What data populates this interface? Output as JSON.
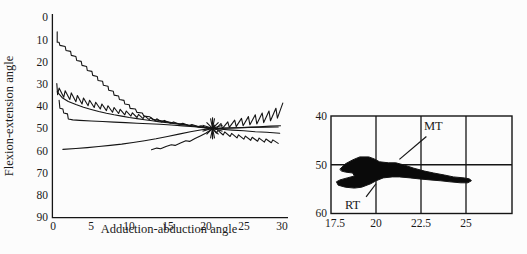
{
  "chart_data": [
    {
      "id": "flexion-vs-adduction",
      "type": "line",
      "xlabel": "Adduction-abduction angle",
      "ylabel": "Flexion-extension angle",
      "xlim": [
        0,
        30
      ],
      "ylim": [
        0,
        90
      ],
      "y_axis_inverted": true,
      "grid": false,
      "x_tick_labels": [
        "0",
        "5",
        "10",
        "15",
        "20",
        "25",
        "30"
      ],
      "x_tick_values": [
        0,
        5,
        10,
        15,
        20,
        25,
        30
      ],
      "y_tick_labels": [
        "0",
        "10",
        "20",
        "30",
        "40",
        "50",
        "60",
        "70",
        "80",
        "90"
      ],
      "y_tick_values": [
        0,
        10,
        20,
        30,
        40,
        50,
        60,
        70,
        80,
        90
      ],
      "line_color": "#151515",
      "convergence_marker": {
        "x": 20.9,
        "y": 50,
        "style": "asterisk-burst"
      },
      "series": [
        {
          "name": "steep-staircase",
          "points": [
            [
              0.55,
              6.5
            ],
            [
              0.55,
              11.2
            ],
            [
              0.8,
              11.2
            ],
            [
              0.9,
              12.6
            ],
            [
              1.6,
              13.1
            ],
            [
              1.7,
              14.9
            ],
            [
              2.3,
              15.3
            ],
            [
              2.4,
              17.1
            ],
            [
              3.0,
              17.6
            ],
            [
              3.1,
              19.4
            ],
            [
              3.7,
              19.8
            ],
            [
              3.8,
              21.6
            ],
            [
              4.4,
              22.1
            ],
            [
              4.5,
              23.9
            ],
            [
              5.1,
              24.3
            ],
            [
              5.2,
              26.1
            ],
            [
              5.8,
              26.6
            ],
            [
              5.9,
              28.4
            ],
            [
              6.5,
              28.8
            ],
            [
              6.6,
              30.6
            ],
            [
              7.2,
              31.0
            ],
            [
              7.3,
              32.8
            ],
            [
              7.9,
              33.3
            ],
            [
              8.0,
              35.0
            ],
            [
              8.6,
              35.4
            ],
            [
              8.7,
              37.0
            ],
            [
              9.3,
              37.4
            ],
            [
              9.4,
              39.0
            ],
            [
              10.0,
              39.4
            ],
            [
              10.1,
              41.0
            ],
            [
              10.8,
              41.3
            ],
            [
              11.0,
              42.8
            ],
            [
              11.7,
              43.1
            ],
            [
              11.9,
              44.5
            ],
            [
              12.7,
              44.8
            ],
            [
              13.0,
              45.9
            ],
            [
              14.0,
              46.5
            ],
            [
              15.0,
              47.1
            ],
            [
              16.0,
              47.7
            ],
            [
              17.0,
              48.2
            ],
            [
              18.0,
              48.7
            ],
            [
              19.0,
              49.2
            ],
            [
              20.0,
              49.7
            ],
            [
              20.9,
              50.1
            ]
          ]
        },
        {
          "name": "sawtooth-left",
          "points": [
            [
              0.5,
              29.8
            ],
            [
              0.6,
              34.8
            ],
            [
              0.8,
              31.8
            ],
            [
              1.4,
              36.0
            ],
            [
              1.6,
              33.0
            ],
            [
              2.2,
              37.0
            ],
            [
              2.4,
              34.0
            ],
            [
              3.0,
              38.0
            ],
            [
              3.2,
              35.2
            ],
            [
              3.8,
              39.0
            ],
            [
              4.0,
              36.3
            ],
            [
              4.6,
              39.8
            ],
            [
              4.8,
              37.3
            ],
            [
              5.4,
              40.6
            ],
            [
              5.6,
              38.2
            ],
            [
              6.2,
              41.3
            ],
            [
              6.4,
              39.0
            ],
            [
              7.0,
              42.0
            ],
            [
              7.2,
              39.8
            ],
            [
              7.8,
              42.7
            ],
            [
              8.0,
              40.6
            ],
            [
              8.6,
              43.3
            ],
            [
              8.8,
              41.4
            ],
            [
              9.4,
              43.9
            ],
            [
              9.6,
              42.2
            ],
            [
              10.2,
              44.5
            ],
            [
              10.4,
              43.0
            ],
            [
              11.0,
              45.1
            ],
            [
              11.2,
              43.7
            ],
            [
              11.8,
              45.6
            ],
            [
              12.0,
              44.4
            ],
            [
              12.6,
              46.1
            ],
            [
              12.8,
              45.1
            ],
            [
              13.4,
              46.6
            ],
            [
              13.6,
              45.7
            ],
            [
              14.2,
              47.1
            ],
            [
              14.6,
              46.4
            ],
            [
              15.4,
              47.7
            ],
            [
              15.8,
              47.1
            ],
            [
              16.6,
              48.2
            ],
            [
              17.0,
              47.7
            ],
            [
              17.8,
              48.7
            ],
            [
              18.2,
              48.3
            ],
            [
              19.0,
              49.2
            ],
            [
              19.4,
              48.9
            ],
            [
              20.2,
              49.7
            ],
            [
              20.9,
              50.1
            ]
          ]
        },
        {
          "name": "gentle-upper",
          "points": [
            [
              0.55,
              33.5
            ],
            [
              1.2,
              36.2
            ],
            [
              2.0,
              37.9
            ],
            [
              3.0,
              39.3
            ],
            [
              4.0,
              40.5
            ],
            [
              5.0,
              41.5
            ],
            [
              6.0,
              42.4
            ],
            [
              7.0,
              43.2
            ],
            [
              8.0,
              43.9
            ],
            [
              9.0,
              44.5
            ],
            [
              10.0,
              45.1
            ],
            [
              11.0,
              45.6
            ],
            [
              12.0,
              46.1
            ],
            [
              13.0,
              46.6
            ],
            [
              14.0,
              47.1
            ],
            [
              15.0,
              47.5
            ],
            [
              16.0,
              47.9
            ],
            [
              17.0,
              48.3
            ],
            [
              18.0,
              48.8
            ],
            [
              19.0,
              49.2
            ],
            [
              20.0,
              49.7
            ],
            [
              20.9,
              50.1
            ],
            [
              22.0,
              50.4
            ],
            [
              23.5,
              50.8
            ],
            [
              25.0,
              51.1
            ],
            [
              26.5,
              51.5
            ],
            [
              28.0,
              51.8
            ],
            [
              29.7,
              52.2
            ]
          ]
        },
        {
          "name": "drop-then-flat",
          "points": [
            [
              0.8,
              37.3
            ],
            [
              0.9,
              40.9
            ],
            [
              1.3,
              41.3
            ],
            [
              1.4,
              43.1
            ],
            [
              1.9,
              43.5
            ],
            [
              2.0,
              45.8
            ],
            [
              2.6,
              46.2
            ],
            [
              3.5,
              46.4
            ],
            [
              5.0,
              46.7
            ],
            [
              6.5,
              46.9
            ],
            [
              8.0,
              47.2
            ],
            [
              9.5,
              47.4
            ],
            [
              11.0,
              47.7
            ],
            [
              12.5,
              47.9
            ],
            [
              14.0,
              48.2
            ],
            [
              15.5,
              48.5
            ],
            [
              17.0,
              48.9
            ],
            [
              18.5,
              49.3
            ],
            [
              20.0,
              49.8
            ],
            [
              20.9,
              50.1
            ],
            [
              22.5,
              50.0
            ],
            [
              24.0,
              49.8
            ],
            [
              25.5,
              49.6
            ],
            [
              27.0,
              49.3
            ],
            [
              28.5,
              49.0
            ],
            [
              29.8,
              48.8
            ]
          ]
        },
        {
          "name": "bottom-long",
          "points": [
            [
              1.3,
              59.5
            ],
            [
              3.0,
              59.1
            ],
            [
              4.5,
              58.7
            ],
            [
              6.0,
              58.2
            ],
            [
              7.5,
              57.7
            ],
            [
              9.0,
              57.1
            ],
            [
              10.5,
              56.4
            ],
            [
              12.0,
              55.6
            ],
            [
              13.5,
              54.7
            ],
            [
              15.0,
              53.7
            ],
            [
              16.5,
              52.6
            ],
            [
              18.0,
              51.5
            ],
            [
              19.5,
              50.6
            ],
            [
              20.9,
              50.1
            ],
            [
              22.0,
              49.9
            ],
            [
              24.0,
              49.7
            ],
            [
              26.0,
              49.6
            ],
            [
              28.0,
              49.5
            ],
            [
              29.5,
              49.4
            ]
          ]
        },
        {
          "name": "bottom-short",
          "points": [
            [
              12.9,
              59.7
            ],
            [
              13.6,
              58.9
            ],
            [
              14.1,
              59.2
            ],
            [
              14.8,
              58.2
            ],
            [
              15.5,
              57.4
            ],
            [
              16.0,
              57.7
            ],
            [
              16.7,
              56.6
            ],
            [
              17.4,
              55.6
            ],
            [
              17.9,
              55.9
            ],
            [
              18.6,
              54.6
            ],
            [
              19.3,
              53.4
            ],
            [
              20.0,
              52.2
            ],
            [
              20.9,
              50.2
            ]
          ]
        },
        {
          "name": "sawtooth-right-up",
          "points": [
            [
              20.9,
              50.0
            ],
            [
              21.1,
              48.5
            ],
            [
              21.3,
              50.4
            ],
            [
              22.0,
              47.8
            ],
            [
              22.2,
              50.0
            ],
            [
              22.9,
              47.1
            ],
            [
              23.1,
              49.6
            ],
            [
              23.8,
              46.3
            ],
            [
              24.0,
              49.2
            ],
            [
              24.7,
              45.5
            ],
            [
              24.9,
              48.8
            ],
            [
              25.6,
              44.7
            ],
            [
              25.8,
              48.4
            ],
            [
              26.5,
              43.9
            ],
            [
              26.7,
              48.0
            ],
            [
              27.4,
              43.1
            ],
            [
              27.6,
              47.4
            ],
            [
              28.3,
              42.2
            ],
            [
              28.5,
              46.6
            ],
            [
              29.2,
              40.9
            ],
            [
              29.4,
              45.4
            ],
            [
              30.1,
              38.6
            ]
          ]
        },
        {
          "name": "sawtooth-right-down",
          "points": [
            [
              20.9,
              50.2
            ],
            [
              21.4,
              52.2
            ],
            [
              21.6,
              50.9
            ],
            [
              22.3,
              53.0
            ],
            [
              22.5,
              51.6
            ],
            [
              23.2,
              53.7
            ],
            [
              23.4,
              52.3
            ],
            [
              24.1,
              54.3
            ],
            [
              24.3,
              52.9
            ],
            [
              25.0,
              54.9
            ],
            [
              25.2,
              53.5
            ],
            [
              25.9,
              55.4
            ],
            [
              26.1,
              54.0
            ],
            [
              26.8,
              55.8
            ],
            [
              27.0,
              54.4
            ],
            [
              27.7,
              56.2
            ],
            [
              27.9,
              54.8
            ],
            [
              28.6,
              56.5
            ],
            [
              28.8,
              55.2
            ],
            [
              29.5,
              56.8
            ]
          ]
        }
      ]
    },
    {
      "id": "contact-region-map",
      "type": "area",
      "xlim": [
        17.5,
        27.5
      ],
      "ylim": [
        40,
        60
      ],
      "y_axis_inverted": true,
      "grid": true,
      "x_tick_labels": [
        "17.5",
        "20",
        "22.5",
        "25"
      ],
      "x_tick_values": [
        17.5,
        20,
        22.5,
        25
      ],
      "y_tick_labels": [
        "40",
        "50",
        "60"
      ],
      "y_tick_values": [
        40,
        50,
        60
      ],
      "region_fill": "#0a0a0a",
      "region_outline": [
        [
          18.0,
          50.9
        ],
        [
          18.3,
          49.8
        ],
        [
          18.7,
          49.0
        ],
        [
          19.1,
          48.4
        ],
        [
          19.6,
          48.4
        ],
        [
          19.9,
          48.8
        ],
        [
          20.2,
          49.4
        ],
        [
          20.7,
          49.6
        ],
        [
          21.1,
          49.6
        ],
        [
          21.6,
          50.1
        ],
        [
          22.1,
          50.7
        ],
        [
          22.7,
          51.3
        ],
        [
          23.2,
          51.7
        ],
        [
          23.8,
          52.1
        ],
        [
          24.3,
          52.5
        ],
        [
          24.9,
          52.7
        ],
        [
          25.2,
          52.9
        ],
        [
          25.3,
          53.3
        ],
        [
          25.1,
          53.7
        ],
        [
          24.7,
          53.7
        ],
        [
          24.1,
          53.5
        ],
        [
          23.6,
          53.3
        ],
        [
          23.0,
          53.1
        ],
        [
          22.4,
          52.9
        ],
        [
          21.9,
          52.7
        ],
        [
          21.3,
          52.5
        ],
        [
          20.9,
          52.5
        ],
        [
          20.4,
          52.7
        ],
        [
          20.0,
          53.3
        ],
        [
          19.7,
          53.9
        ],
        [
          19.2,
          54.6
        ],
        [
          18.8,
          54.8
        ],
        [
          18.3,
          54.6
        ],
        [
          17.9,
          54.2
        ],
        [
          17.8,
          53.5
        ],
        [
          18.0,
          53.1
        ],
        [
          18.4,
          52.7
        ],
        [
          18.8,
          52.3
        ],
        [
          18.7,
          51.7
        ],
        [
          18.3,
          51.5
        ],
        [
          18.1,
          51.3
        ]
      ],
      "annotations": [
        {
          "label": "MT",
          "line_from": [
            22.8,
            44.2
          ],
          "line_to": [
            21.3,
            48.9
          ]
        },
        {
          "label": "RT",
          "line_from": [
            19.45,
            56.6
          ],
          "line_to": [
            20.0,
            53.9
          ]
        }
      ]
    }
  ]
}
